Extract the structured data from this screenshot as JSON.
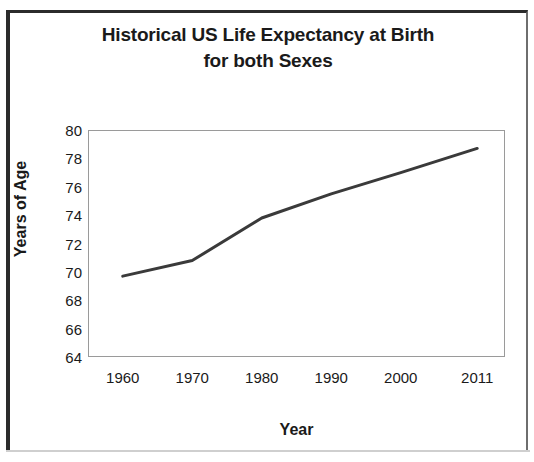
{
  "figure": {
    "background_color": "#ffffff",
    "frame_color": "#2b2b2b",
    "plot_border_color": "#9a9a9a"
  },
  "chart_data": {
    "type": "line",
    "title": "Historical US Life Expectancy at Birth for both Sexes",
    "title_line_1": "Historical US Life Expectancy at Birth",
    "title_line_2": "for both Sexes",
    "xlabel": "Year",
    "ylabel": "Years of Age",
    "x": [
      1960,
      1970,
      1980,
      1990,
      2000,
      2011
    ],
    "x_tick_labels": [
      "1960",
      "1970",
      "1980",
      "1990",
      "2000",
      "2011"
    ],
    "values": [
      69.7,
      70.8,
      73.8,
      75.5,
      77.0,
      78.7
    ],
    "series": [
      {
        "name": "Life expectancy at birth, both sexes",
        "values": [
          69.7,
          70.8,
          73.8,
          75.5,
          77.0,
          78.7
        ],
        "color": "#3a3a3a"
      }
    ],
    "ylim": [
      64,
      80
    ],
    "xlim": [
      1955,
      2015
    ],
    "y_ticks": [
      80,
      78,
      76,
      74,
      72,
      70,
      68,
      66,
      64
    ],
    "y_tick_labels": [
      "80",
      "78",
      "76",
      "74",
      "72",
      "70",
      "68",
      "66",
      "64"
    ],
    "grid": false,
    "legend": null,
    "legend_position": "none",
    "line_color": "#3a3a3a",
    "line_width": 3,
    "markers": false
  }
}
